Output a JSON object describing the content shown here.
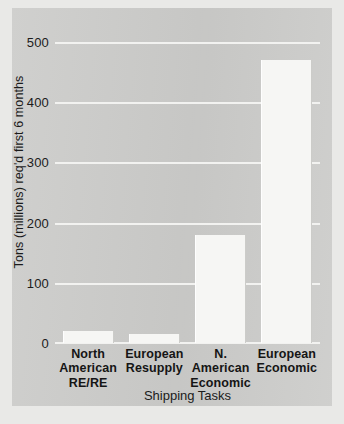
{
  "chart_data": {
    "type": "bar",
    "title": "",
    "xlabel": "Shipping Tasks",
    "ylabel": "Tons (millions) req'd first 6 months",
    "categories": [
      "North American\nRE/RE",
      "European\nResupply",
      "N. American\nEconomic",
      "European\nEconomic"
    ],
    "category_lines": [
      [
        "North American",
        "RE/RE"
      ],
      [
        "European",
        "Resupply"
      ],
      [
        "N. American",
        "Economic"
      ],
      [
        "European",
        "Economic"
      ]
    ],
    "values": [
      20,
      15,
      180,
      470
    ],
    "ylim": [
      0,
      520
    ],
    "yticks": [
      0,
      100,
      200,
      300,
      400,
      500
    ],
    "ytick_labels": [
      "0",
      "100",
      "200",
      "300",
      "400",
      "500"
    ],
    "grid": true,
    "legend": false,
    "colors": {
      "panel_background": "#cdcdcb",
      "page_background": "#e9e9e7",
      "bar_fill": "#f6f6f4",
      "gridline": "#f2f2f0",
      "text": "#1b1b1b"
    }
  }
}
